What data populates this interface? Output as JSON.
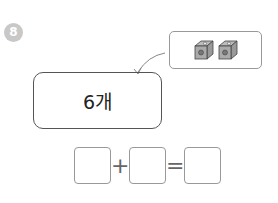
{
  "problem": {
    "number": "8",
    "answer_text": "6개",
    "picture": {
      "items": [
        "cube-icon",
        "cube-icon"
      ],
      "count": 2
    }
  },
  "equation": {
    "blanks": [
      "",
      "",
      ""
    ],
    "plus": "+",
    "equals": "="
  }
}
